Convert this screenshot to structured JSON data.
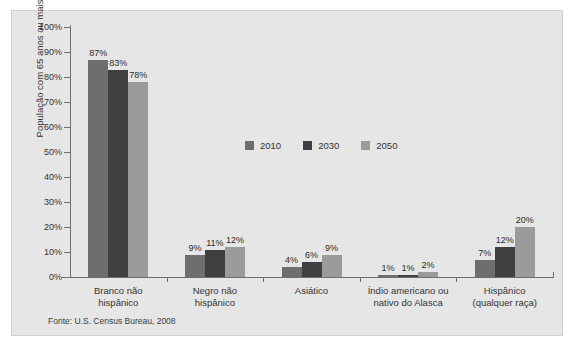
{
  "chart_data": {
    "type": "bar",
    "title": "",
    "subtitle": "",
    "xlabel": "",
    "ylabel": "População com 65 anos ou mais",
    "ylim": [
      0,
      100
    ],
    "ytick_labels": [
      "0%",
      "10%",
      "20%",
      "30%",
      "40%",
      "50%",
      "60%",
      "70%",
      "80%",
      "90%",
      "100%"
    ],
    "ytick_values": [
      0,
      10,
      20,
      30,
      40,
      50,
      60,
      70,
      80,
      90,
      100
    ],
    "grid": false,
    "legend_position": "center",
    "categories": [
      "Branco não hispânico",
      "Negro não hispânico",
      "Asiático",
      "Índio americano ou nativo do Alasca",
      "Hispânico (qualquer raça)"
    ],
    "category_lines": [
      [
        "Branco não",
        "hispânico"
      ],
      [
        "Negro não",
        "hispânico"
      ],
      [
        "Asiático",
        ""
      ],
      [
        "Índio americano ou",
        "nativo do Alasca"
      ],
      [
        "Hispânico",
        "(qualquer raça)"
      ]
    ],
    "series": [
      {
        "name": "2010",
        "color": "#6e6e6e",
        "values": [
          87,
          9,
          4,
          1,
          7
        ],
        "value_labels": [
          "87%",
          "9%",
          "4%",
          "1%",
          "7%"
        ]
      },
      {
        "name": "2030",
        "color": "#3f3f3f",
        "values": [
          83,
          11,
          6,
          1,
          12
        ],
        "value_labels": [
          "83%",
          "11%",
          "6%",
          "1%",
          "12%"
        ]
      },
      {
        "name": "2050",
        "color": "#9b9b9b",
        "values": [
          78,
          12,
          9,
          2,
          20
        ],
        "value_labels": [
          "78%",
          "12%",
          "9%",
          "2%",
          "20%"
        ]
      }
    ],
    "source_note": "Fonte: U.S. Census Bureau, 2008",
    "panel_background": "#e6e6e6",
    "axis_color": "#6e6e6e",
    "text_color": "#333333"
  }
}
